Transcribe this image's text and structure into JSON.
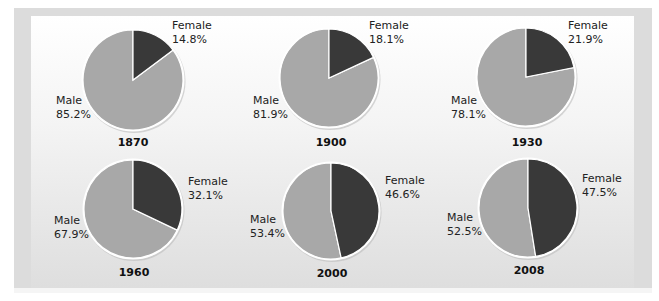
{
  "chart_data": {
    "type": "pie",
    "title": "",
    "slice_labels": [
      "Male",
      "Female"
    ],
    "colors": {
      "Male": "#a8a8a8",
      "Female": "#393939"
    },
    "charts": [
      {
        "year": "1870",
        "male": 85.2,
        "female": 14.8,
        "male_label": "Male",
        "male_value": "85.2%",
        "female_label": "Female",
        "female_value": "14.8%"
      },
      {
        "year": "1900",
        "male": 81.9,
        "female": 18.1,
        "male_label": "Male",
        "male_value": "81.9%",
        "female_label": "Female",
        "female_value": "18.1%"
      },
      {
        "year": "1930",
        "male": 78.1,
        "female": 21.9,
        "male_label": "Male",
        "male_value": "78.1%",
        "female_label": "Female",
        "female_value": "21.9%"
      },
      {
        "year": "1960",
        "male": 67.9,
        "female": 32.1,
        "male_label": "Male",
        "male_value": "67.9%",
        "female_label": "Female",
        "female_value": "32.1%"
      },
      {
        "year": "2000",
        "male": 53.4,
        "female": 46.6,
        "male_label": "Male",
        "male_value": "53.4%",
        "female_label": "Female",
        "female_value": "46.6%"
      },
      {
        "year": "2008",
        "male": 52.5,
        "female": 47.5,
        "male_label": "Male",
        "male_value": "52.5%",
        "female_label": "Female",
        "female_value": "47.5%"
      }
    ]
  },
  "layout": {
    "pies": [
      {
        "cx": 133,
        "cy": 80,
        "r": 50,
        "female_lbl": [
          172,
          29
        ],
        "male_lbl": [
          56,
          104
        ],
        "year_lbl": [
          133,
          146
        ]
      },
      {
        "cx": 329,
        "cy": 78,
        "r": 49,
        "female_lbl": [
          369,
          29
        ],
        "male_lbl": [
          253,
          104
        ],
        "year_lbl": [
          331,
          146
        ]
      },
      {
        "cx": 526,
        "cy": 77,
        "r": 49,
        "female_lbl": [
          568,
          29
        ],
        "male_lbl": [
          451,
          104
        ],
        "year_lbl": [
          527,
          146
        ]
      },
      {
        "cx": 133,
        "cy": 209,
        "r": 49,
        "female_lbl": [
          188,
          185
        ],
        "male_lbl": [
          54,
          224
        ],
        "year_lbl": [
          134,
          276
        ]
      },
      {
        "cx": 331,
        "cy": 211,
        "r": 48,
        "female_lbl": [
          385,
          184
        ],
        "male_lbl": [
          250,
          223
        ],
        "year_lbl": [
          332,
          277
        ]
      },
      {
        "cx": 528,
        "cy": 208,
        "r": 49,
        "female_lbl": [
          582,
          182
        ],
        "male_lbl": [
          447,
          221
        ],
        "year_lbl": [
          529,
          274
        ]
      }
    ]
  }
}
